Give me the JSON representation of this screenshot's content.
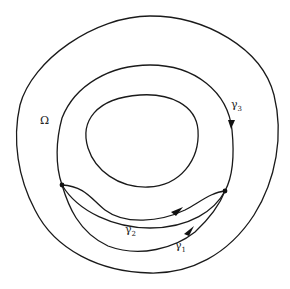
{
  "figure": {
    "labels": {
      "omega": "Ω",
      "gamma": "γ",
      "gamma1_sub": "1",
      "gamma2_sub": "2",
      "gamma3_sub": "3"
    },
    "colors": {
      "stroke": "#1a1a1a",
      "background": "#ffffff"
    }
  }
}
